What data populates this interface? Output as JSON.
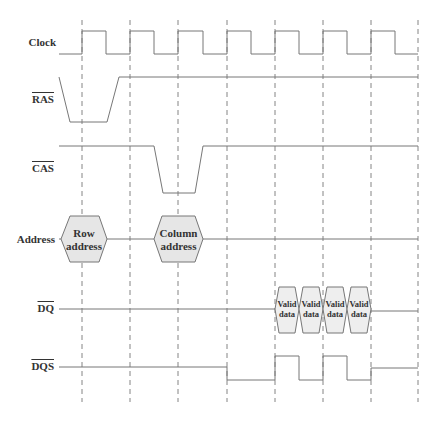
{
  "diagram": {
    "type": "timing-diagram",
    "title": "",
    "clock_edges_x": [
      82,
      130,
      178,
      227,
      275,
      323,
      371,
      418
    ],
    "line_color": "#777777",
    "fill_color": "#e6e6e6",
    "signals": [
      {
        "id": "clock",
        "label": "Clock",
        "active_low": false
      },
      {
        "id": "ras",
        "label": "RAS",
        "active_low": true
      },
      {
        "id": "cas",
        "label": "CAS",
        "active_low": true
      },
      {
        "id": "address",
        "label": "Address",
        "active_low": false
      },
      {
        "id": "dq",
        "label": "DQ",
        "active_low": true
      },
      {
        "id": "dqs",
        "label": "DQS",
        "active_low": true
      }
    ],
    "address_boxes": [
      {
        "line1": "Row",
        "line2": "address"
      },
      {
        "line1": "Column",
        "line2": "address"
      }
    ],
    "data_boxes": [
      {
        "line1": "Valid",
        "line2": "data"
      },
      {
        "line1": "Valid",
        "line2": "data"
      },
      {
        "line1": "Valid",
        "line2": "data"
      },
      {
        "line1": "Valid",
        "line2": "data"
      }
    ]
  }
}
